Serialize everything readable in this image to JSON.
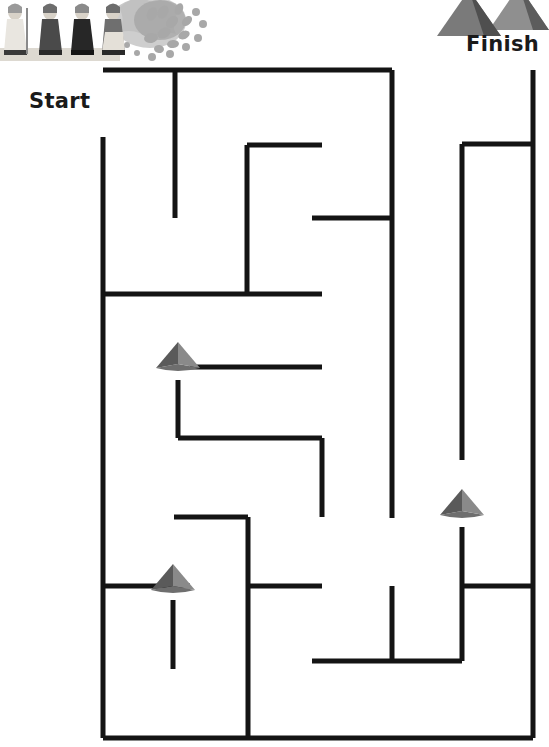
{
  "page": {
    "type": "printable-maze-puzzle",
    "theme": "ancient-egypt",
    "width": 549,
    "height": 747,
    "background_color": "#ffffff",
    "wall_color": "#141414",
    "wall_thickness": 5
  },
  "labels": {
    "start": "Start",
    "finish": "Finish",
    "start_color": "#1a1a1a",
    "finish_color": "#1a1a1a"
  },
  "artwork": {
    "top_left": {
      "name": "egyptian-figures-illustration",
      "description": "Row of four robed Egyptian figures with staffs in front of a stylised sun-burst / palm fan",
      "colors": {
        "robe_light": "#e9e6e0",
        "robe_mid": "#9a9a9a",
        "robe_dark": "#3a3a3a",
        "accent": "#b7b7b7",
        "skin": "#d8d2c8"
      }
    },
    "top_right": {
      "name": "pyramids-illustration",
      "description": "Two overlapping great pyramids silhouette",
      "colors": {
        "face_light": "#8f8f8f",
        "face_dark": "#4f4f4f",
        "face_mid": "#6d6d6d"
      }
    }
  },
  "markers": {
    "label": "pyramid direction markers",
    "fill_light": "#8a8a8a",
    "fill_dark": "#5a5a5a",
    "fill_mid": "#6e6e6e",
    "items": [
      {
        "name": "pyramid-marker-upper",
        "x": 178,
        "y": 368,
        "direction": "up"
      },
      {
        "name": "pyramid-marker-right",
        "x": 462,
        "y": 515,
        "direction": "up"
      },
      {
        "name": "pyramid-marker-lower",
        "x": 173,
        "y": 590,
        "direction": "up"
      }
    ]
  },
  "maze": {
    "bounds": {
      "left": 103,
      "top": 70,
      "right": 533,
      "bottom": 738
    },
    "entrance": {
      "name": "start-gap",
      "side": "left",
      "from_y": 70,
      "to_y": 137
    },
    "exit": {
      "name": "finish-gap",
      "side": "top",
      "from_x": 392,
      "to_x": 533
    },
    "h_walls": [
      {
        "name": "wall-top-outer",
        "x1": 103,
        "x2": 392,
        "y": 70
      },
      {
        "name": "wall-upper-inner-1",
        "x1": 247,
        "x2": 322,
        "y": 145
      },
      {
        "name": "wall-right-upper",
        "x1": 462,
        "x2": 533,
        "y": 144
      },
      {
        "name": "wall-mid-upper",
        "x1": 312,
        "x2": 392,
        "y": 218
      },
      {
        "name": "wall-mid-long",
        "x1": 103,
        "x2": 322,
        "y": 294
      },
      {
        "name": "wall-marker-upper-row",
        "x1": 190,
        "x2": 322,
        "y": 367
      },
      {
        "name": "wall-zig-lower",
        "x1": 178,
        "x2": 322,
        "y": 438
      },
      {
        "name": "wall-lower-left",
        "x1": 174,
        "x2": 248,
        "y": 517
      },
      {
        "name": "wall-lower-mid",
        "x1": 248,
        "x2": 322,
        "y": 586
      },
      {
        "name": "wall-marker-lower-row",
        "x1": 103,
        "x2": 190,
        "y": 586
      },
      {
        "name": "wall-right-lower",
        "x1": 462,
        "x2": 533,
        "y": 586
      },
      {
        "name": "wall-bottom-inner",
        "x1": 312,
        "x2": 462,
        "y": 661
      },
      {
        "name": "wall-bottom-outer",
        "x1": 103,
        "x2": 533,
        "y": 738
      }
    ],
    "v_walls": [
      {
        "name": "wall-left-outer",
        "x": 103,
        "y1": 137,
        "y2": 738
      },
      {
        "name": "wall-top-stub",
        "x": 175,
        "y1": 70,
        "y2": 218
      },
      {
        "name": "wall-upper-inner-v",
        "x": 247,
        "y1": 145,
        "y2": 294
      },
      {
        "name": "wall-center-long",
        "x": 392,
        "y1": 70,
        "y2": 518
      },
      {
        "name": "wall-right-inner",
        "x": 462,
        "y1": 144,
        "y2": 460
      },
      {
        "name": "wall-right-outer",
        "x": 533,
        "y1": 70,
        "y2": 738
      },
      {
        "name": "wall-zig-v",
        "x": 178,
        "y1": 380,
        "y2": 438
      },
      {
        "name": "wall-zig-right-v",
        "x": 322,
        "y1": 438,
        "y2": 517
      },
      {
        "name": "wall-lower-left-v",
        "x": 248,
        "y1": 517,
        "y2": 738
      },
      {
        "name": "wall-marker-lower-v",
        "x": 173,
        "y1": 600,
        "y2": 669
      },
      {
        "name": "wall-bottom-stub-v",
        "x": 392,
        "y1": 586,
        "y2": 661
      },
      {
        "name": "wall-marker-right-v",
        "x": 462,
        "y1": 527,
        "y2": 661
      }
    ]
  }
}
